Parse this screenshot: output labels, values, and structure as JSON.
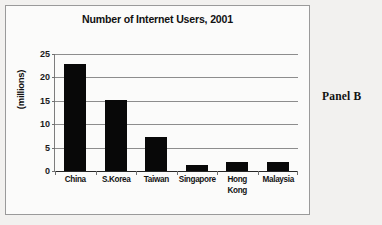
{
  "panel_caption": "Panel B",
  "chart_data": {
    "type": "bar",
    "title": "Number of Internet Users, 2001",
    "xlabel": "",
    "ylabel": "(millions)",
    "categories": [
      "China",
      "S.Korea",
      "Taiwan",
      "Singapore",
      "Hong Kong",
      "Malaysia"
    ],
    "category_lines": [
      [
        "China"
      ],
      [
        "S.Korea"
      ],
      [
        "Taiwan"
      ],
      [
        "Singapore"
      ],
      [
        "Hong",
        "Kong"
      ],
      [
        "Malaysia"
      ]
    ],
    "values": [
      22.8,
      15.2,
      7.2,
      1.2,
      2.0,
      2.0
    ],
    "ylim": [
      0,
      25
    ],
    "yticks": [
      0,
      5,
      10,
      15,
      20,
      25
    ],
    "ytick_labels": [
      "0",
      "5",
      "10",
      "15",
      "20",
      "25"
    ],
    "grid": true,
    "legend": false,
    "bar_color": "#080808",
    "plot_background": "#fbfbfa",
    "gridline_color": "#8d8d8d"
  }
}
